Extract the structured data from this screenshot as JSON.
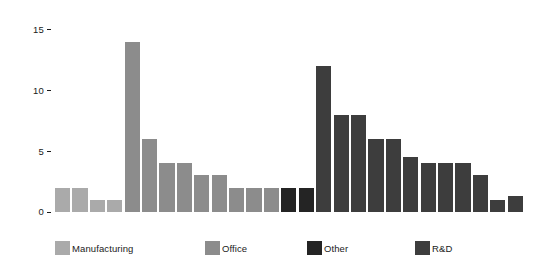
{
  "chart_data": {
    "type": "bar",
    "title": "",
    "subtitle": "",
    "xlabel": "",
    "ylabel": "",
    "grid": false,
    "ylim": [
      0,
      15.6
    ],
    "xlim": [
      0,
      30
    ],
    "y_ticks": [
      0,
      5,
      10,
      15
    ],
    "y_tick_labels": [
      "0",
      "5",
      "10",
      "15"
    ],
    "x_tick_labels": [],
    "legend_position": "bottom",
    "legend": [
      {
        "name": "Manufacturing",
        "color": "#aaaaaa"
      },
      {
        "name": "Office",
        "color": "#8c8c8c"
      },
      {
        "name": "Other",
        "color": "#242424"
      },
      {
        "name": "R&D",
        "color": "#3d3d3d"
      }
    ],
    "series": [
      {
        "name": "Manufacturing",
        "color": "#aaaaaa",
        "values": [
          2,
          2,
          1,
          1
        ]
      },
      {
        "name": "Office",
        "color": "#8c8c8c",
        "values": [
          14,
          6,
          4,
          4,
          3,
          3,
          2,
          2,
          2
        ]
      },
      {
        "name": "Other",
        "color": "#242424",
        "values": [
          2,
          2
        ]
      },
      {
        "name": "R&D",
        "color": "#3d3d3d",
        "values": [
          12,
          8,
          8,
          6,
          6,
          4.5,
          4,
          4,
          4,
          3,
          1,
          1.3
        ]
      }
    ],
    "bars": [
      {
        "index": 0,
        "value": 2,
        "group": "Manufacturing",
        "color": "#aaaaaa"
      },
      {
        "index": 1,
        "value": 2,
        "group": "Manufacturing",
        "color": "#aaaaaa"
      },
      {
        "index": 2,
        "value": 1,
        "group": "Manufacturing",
        "color": "#aaaaaa"
      },
      {
        "index": 3,
        "value": 1,
        "group": "Manufacturing",
        "color": "#aaaaaa"
      },
      {
        "index": 4,
        "value": 14,
        "group": "Office",
        "color": "#8c8c8c"
      },
      {
        "index": 5,
        "value": 6,
        "group": "Office",
        "color": "#8c8c8c"
      },
      {
        "index": 6,
        "value": 4,
        "group": "Office",
        "color": "#8c8c8c"
      },
      {
        "index": 7,
        "value": 4,
        "group": "Office",
        "color": "#8c8c8c"
      },
      {
        "index": 8,
        "value": 3,
        "group": "Office",
        "color": "#8c8c8c"
      },
      {
        "index": 9,
        "value": 3,
        "group": "Office",
        "color": "#8c8c8c"
      },
      {
        "index": 10,
        "value": 2,
        "group": "Office",
        "color": "#8c8c8c"
      },
      {
        "index": 11,
        "value": 2,
        "group": "Office",
        "color": "#8c8c8c"
      },
      {
        "index": 12,
        "value": 2,
        "group": "Office",
        "color": "#8c8c8c"
      },
      {
        "index": 13,
        "value": 2,
        "group": "Other",
        "color": "#242424"
      },
      {
        "index": 14,
        "value": 2,
        "group": "Other",
        "color": "#242424"
      },
      {
        "index": 15,
        "value": 12,
        "group": "R&D",
        "color": "#3d3d3d"
      },
      {
        "index": 16,
        "value": 8,
        "group": "R&D",
        "color": "#3d3d3d"
      },
      {
        "index": 17,
        "value": 8,
        "group": "R&D",
        "color": "#3d3d3d"
      },
      {
        "index": 18,
        "value": 6,
        "group": "R&D",
        "color": "#3d3d3d"
      },
      {
        "index": 19,
        "value": 6,
        "group": "R&D",
        "color": "#3d3d3d"
      },
      {
        "index": 20,
        "value": 4.5,
        "group": "R&D",
        "color": "#3d3d3d"
      },
      {
        "index": 21,
        "value": 4,
        "group": "R&D",
        "color": "#3d3d3d"
      },
      {
        "index": 22,
        "value": 4,
        "group": "R&D",
        "color": "#3d3d3d"
      },
      {
        "index": 23,
        "value": 4,
        "group": "R&D",
        "color": "#3d3d3d"
      },
      {
        "index": 24,
        "value": 3,
        "group": "R&D",
        "color": "#3d3d3d"
      },
      {
        "index": 25,
        "value": 1,
        "group": "R&D",
        "color": "#3d3d3d"
      },
      {
        "index": 26,
        "value": 1.3,
        "group": "R&D",
        "color": "#3d3d3d"
      }
    ]
  },
  "axis": {
    "tick_0": "0",
    "tick_5": "5",
    "tick_10": "10",
    "tick_15": "15"
  },
  "legend": {
    "manufacturing_label": "Manufacturing",
    "office_label": "Office",
    "other_label": "Other",
    "rd_label": "R&D"
  }
}
